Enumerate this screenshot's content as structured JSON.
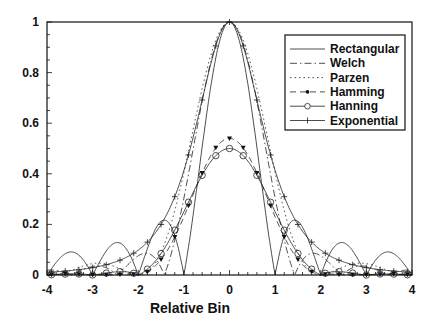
{
  "chart_data": {
    "type": "line",
    "title": "",
    "xlabel": "Relative Bin",
    "ylabel": "",
    "xlim": [
      -4,
      4
    ],
    "ylim": [
      0,
      1
    ],
    "xticks": [
      "-4",
      "-3",
      "-2",
      "-1",
      "0",
      "1",
      "2",
      "3",
      "4"
    ],
    "yticks": [
      "0",
      "0.2",
      "0.4",
      "0.6",
      "0.8",
      "1"
    ],
    "grid": false,
    "legend_position": "upper right",
    "x": [
      -4,
      -3.5,
      -3,
      -2.5,
      -2,
      -1.5,
      -1,
      -0.75,
      -0.5,
      -0.25,
      0,
      0.25,
      0.5,
      0.75,
      1,
      1.5,
      2,
      2.5,
      3,
      3.5,
      4
    ],
    "series": [
      {
        "name": "Rectangular",
        "style": "solid",
        "values": [
          0,
          0.09,
          0,
          0.13,
          0,
          0.21,
          0,
          0.3,
          0.64,
          0.9,
          1,
          0.9,
          0.64,
          0.3,
          0,
          0.21,
          0,
          0.13,
          0,
          0.09,
          0
        ]
      },
      {
        "name": "Welch",
        "style": "dash-dot",
        "values": [
          0.01,
          0.01,
          0.01,
          0.02,
          0.02,
          0.09,
          0.3,
          0.55,
          0.77,
          0.94,
          1,
          0.94,
          0.77,
          0.55,
          0.3,
          0.09,
          0.02,
          0.02,
          0.01,
          0.01,
          0.01
        ]
      },
      {
        "name": "Parzen",
        "style": "dotted",
        "values": [
          0.01,
          0.02,
          0.03,
          0.04,
          0.07,
          0.18,
          0.38,
          0.58,
          0.78,
          0.94,
          1,
          0.94,
          0.78,
          0.58,
          0.38,
          0.18,
          0.07,
          0.04,
          0.03,
          0.02,
          0.01
        ]
      },
      {
        "name": "Hamming",
        "style": "dash-marker-filled",
        "values": [
          0.01,
          0.01,
          0.01,
          0.01,
          0.02,
          0.16,
          0.43,
          0.62,
          0.81,
          0.95,
          1,
          0.95,
          0.81,
          0.62,
          0.43,
          0.16,
          0.02,
          0.01,
          0.01,
          0.01,
          0.01
        ]
      },
      {
        "name": "Hanning",
        "style": "solid-marker-circle",
        "values": [
          0.01,
          0.01,
          0.01,
          0.02,
          0.05,
          0.2,
          0.5,
          0.68,
          0.85,
          0.96,
          1,
          0.96,
          0.85,
          0.68,
          0.5,
          0.2,
          0.05,
          0.02,
          0.01,
          0.01,
          0.01
        ]
      },
      {
        "name": "Exponential",
        "style": "solid-marker-plus",
        "values": [
          0.01,
          0.01,
          0.02,
          0.04,
          0.12,
          0.3,
          0.55,
          0.72,
          0.87,
          0.97,
          1,
          0.97,
          0.87,
          0.72,
          0.55,
          0.3,
          0.12,
          0.04,
          0.02,
          0.01,
          0.01
        ]
      }
    ]
  }
}
